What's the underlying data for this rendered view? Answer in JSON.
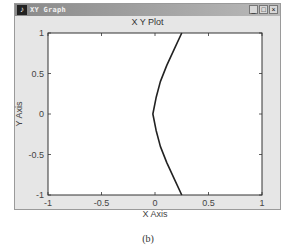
{
  "window": {
    "title": "XY Graph",
    "icon": "app-icon",
    "buttons": {
      "minimize": "_",
      "maximize": "□",
      "close": "×"
    }
  },
  "chart_data": {
    "type": "line",
    "title": "X Y Plot",
    "xlabel": "X Axis",
    "ylabel": "Y Axis",
    "xlim": [
      -1,
      1
    ],
    "ylim": [
      -1,
      1
    ],
    "xticks": [
      "-1",
      "-0.5",
      "0",
      "0.5",
      "1"
    ],
    "yticks": [
      "1",
      "0.5",
      "0",
      "-0.5",
      "-1"
    ],
    "grid": false,
    "legend": null,
    "series": [
      {
        "name": "curve",
        "x": [
          0.25,
          0.18,
          0.11,
          0.05,
          0.01,
          -0.02,
          0.01,
          0.05,
          0.11,
          0.18,
          0.25
        ],
        "y": [
          1.0,
          0.8,
          0.6,
          0.4,
          0.2,
          0.0,
          -0.2,
          -0.4,
          -0.6,
          -0.8,
          -1.0
        ]
      }
    ]
  },
  "caption": "(b)"
}
